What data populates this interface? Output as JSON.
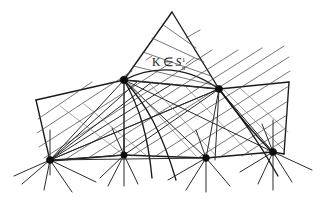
{
  "figure": {
    "kind": "hand-drawn-geometric-diagram",
    "background_color": "#ffffff",
    "ink_color": "#1a1a1a",
    "width": 329,
    "height": 203,
    "annotations": [
      {
        "id": "k-membership",
        "name": "k-in-script-s-label",
        "full_text": "K ∈ 𝒮",
        "symbol_k": "K",
        "symbol_member": "∈",
        "symbol_family": "𝒮",
        "superscript": "1",
        "subscript": "n",
        "x": 152,
        "y": 64
      }
    ],
    "vertices": [
      {
        "name": "bottom-vertex-1",
        "x": 50,
        "y": 160,
        "r": 3.6
      },
      {
        "name": "bottom-vertex-2",
        "x": 124,
        "y": 155,
        "r": 3.2
      },
      {
        "name": "bottom-vertex-3",
        "x": 206,
        "y": 158,
        "r": 3.4
      },
      {
        "name": "bottom-vertex-4",
        "x": 273,
        "y": 152,
        "r": 3.6
      },
      {
        "name": "upper-vertex-left",
        "x": 124,
        "y": 80,
        "r": 3.8
      },
      {
        "name": "upper-vertex-right",
        "x": 219,
        "y": 89,
        "r": 3.6
      }
    ],
    "apex": {
      "name": "triangle-apex",
      "x": 172,
      "y": 12
    },
    "outer_quad": {
      "name": "outer-quadrilateral",
      "points": "36,100 124,80 219,89 289,82 284,154 206,158 124,155 50,160"
    },
    "triangle": {
      "name": "upper-triangle",
      "points": "172,12 124,80 219,89"
    },
    "arc": {
      "name": "upper-arc",
      "path": "M 124,80 Q 172,58 219,89"
    }
  },
  "caption": {
    "text": ""
  }
}
